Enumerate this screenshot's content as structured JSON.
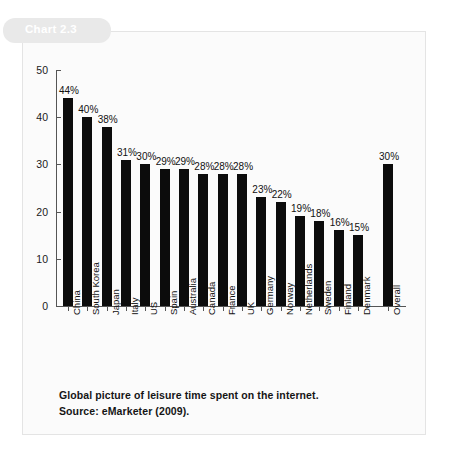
{
  "chart_tag": {
    "label": "Chart 2.3"
  },
  "caption": {
    "line1": "Global picture of leisure time spent on the internet.",
    "line2": "Source: eMarketer (2009)."
  },
  "chart_data": {
    "type": "bar",
    "title": "",
    "subtitle": "",
    "xlabel": "",
    "ylabel": "",
    "ylim": [
      0,
      50
    ],
    "yticks": [
      0,
      10,
      20,
      30,
      40,
      50
    ],
    "ytick_labels": [
      "0",
      "10",
      "20",
      "30",
      "40",
      "50"
    ],
    "grid": false,
    "legend": "none",
    "bar_color": "#0c0c0c",
    "categories": [
      "China",
      "South Korea",
      "Japan",
      "Italy",
      "US",
      "Spain",
      "Australia",
      "Canada",
      "France",
      "UK",
      "Germany",
      "Norway",
      "Netherlands",
      "Sweden",
      "Finland",
      "Denmark",
      "Overall"
    ],
    "values": [
      44,
      40,
      38,
      31,
      30,
      29,
      29,
      28,
      28,
      28,
      23,
      22,
      19,
      18,
      16,
      15,
      30
    ],
    "value_labels": [
      "44%",
      "40%",
      "38%",
      "31%",
      "30%",
      "29%",
      "29%",
      "28%",
      "28%",
      "28%",
      "23%",
      "22%",
      "19%",
      "18%",
      "16%",
      "15%",
      "30%"
    ]
  }
}
